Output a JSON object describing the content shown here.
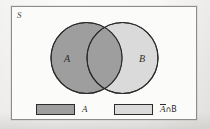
{
  "figure": {
    "type": "venn-diagram",
    "universe_label": "S",
    "sets": [
      {
        "name": "A",
        "label": "A",
        "fill": "#9e9e9e",
        "position": "left"
      },
      {
        "name": "B",
        "label": "B",
        "fill": "#dadada",
        "position": "right"
      }
    ],
    "intersection": {
      "label": "",
      "fill": "#9e9e9e",
      "shaded": true
    },
    "colors": {
      "dark_gray": "#9e9e9e",
      "light_gray": "#dadada",
      "outline": "#2b2b2b",
      "box_border": "#8e8d8b",
      "page_background": "#fbfbfa",
      "text": "#2e2d2c"
    }
  },
  "legend": {
    "items": [
      {
        "swatch": "dark",
        "label": "A",
        "overbar": false,
        "suffix": ""
      },
      {
        "swatch": "light",
        "label": "A",
        "overbar": true,
        "suffix": "∩B"
      }
    ],
    "item_one_label": "A",
    "item_two_overbar_char": "A",
    "item_two_suffix": "∩B",
    "item_two_full": "Ā∩B"
  }
}
